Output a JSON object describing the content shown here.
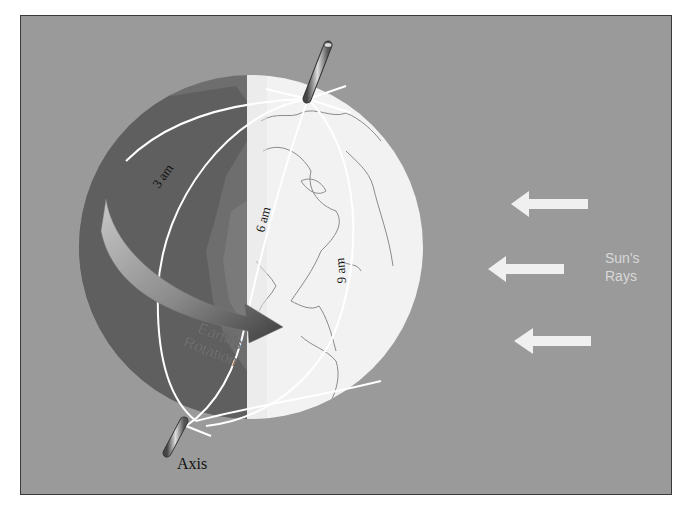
{
  "diagram": {
    "labels": {
      "time_3am": "3 am",
      "time_6am": "6 am",
      "time_9am": "9 am",
      "rotation_line1": "Earth's",
      "rotation_line2": "Rotation",
      "sun_line1": "Sun's",
      "sun_line2": "Rays",
      "axis": "Axis"
    },
    "sun_rays": {
      "count": 3,
      "direction": "left"
    },
    "colors": {
      "background": "#9a9a9a",
      "night_side": "#6e6e6e",
      "night_land": "#5f5f5f",
      "day_side": "#f2f2f2",
      "coastline": "#8a8a8a",
      "meridian": "#ffffff",
      "arrow_light": "#bdbdbd",
      "arrow_dark": "#444444",
      "sun_arrow": "#f0f0f0",
      "sun_text": "#d8d8d8",
      "axis_text": "#111111",
      "border": "#3a3a3a"
    }
  }
}
